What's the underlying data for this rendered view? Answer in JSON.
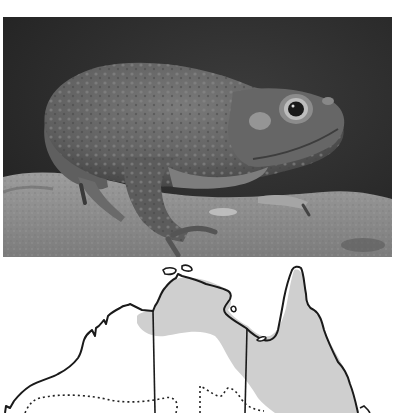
{
  "photo": {
    "subject": "toad-on-rock",
    "style": "grayscale",
    "colors": {
      "background_dark": "#2a2a2a",
      "background_mid": "#3a3a3a",
      "rock": "#8e8e8e",
      "rock_light": "#a6a6a6",
      "toad_body": "#6b6b6b",
      "toad_shadow": "#4a4a4a",
      "toad_highlight": "#9a9a9a",
      "eye_ring": "#b5b5b5",
      "pupil": "#0f0f0f"
    }
  },
  "map": {
    "subject": "northern-australia-distribution-map",
    "colors": {
      "land_outline": "#1a1a1a",
      "range_fill": "#cfcfcf",
      "background": "#ffffff",
      "dotted_boundary": "#222222"
    }
  }
}
